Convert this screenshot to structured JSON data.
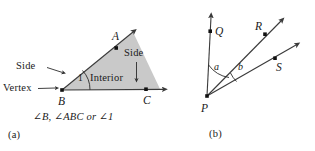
{
  "figure": {
    "colors": {
      "ink": "#1a1a1a",
      "stroke": "#3a3a3a",
      "interior_fill": "#c9c9c9",
      "background": "#ffffff"
    },
    "panel_a": {
      "sublabel": "(a)",
      "caption": "∠B, ∠ABC or ∠1",
      "annotations": {
        "side_left": "Side",
        "side_right": "Side",
        "vertex": "Vertex",
        "interior": "Interior",
        "angle_number": "1"
      },
      "points": [
        {
          "name": "A",
          "label": "A",
          "x": 117,
          "y": 44
        },
        {
          "name": "B",
          "label": "B",
          "x": 62,
          "y": 90
        },
        {
          "name": "C",
          "label": "C",
          "x": 146,
          "y": 89
        }
      ],
      "rays": [
        {
          "name": "ray-BA",
          "from": "B",
          "through": "A",
          "tip_x": 135,
          "tip_y": 30
        },
        {
          "name": "ray-BC",
          "from": "B",
          "through": "C",
          "tip_x": 165,
          "tip_y": 89
        }
      ]
    },
    "panel_b": {
      "sublabel": "(b)",
      "annotations": {
        "angle_a": "a",
        "angle_b": "b"
      },
      "points": [
        {
          "name": "P",
          "label": "P",
          "x": 207,
          "y": 96
        },
        {
          "name": "Q",
          "label": "Q",
          "x": 210,
          "y": 31
        },
        {
          "name": "R",
          "label": "R",
          "x": 265,
          "y": 34
        },
        {
          "name": "S",
          "label": "S",
          "x": 275,
          "y": 58
        }
      ],
      "rays": [
        {
          "name": "ray-PQ",
          "from": "P",
          "through": "Q",
          "tip_x": 211,
          "tip_y": 15
        },
        {
          "name": "ray-PR",
          "from": "P",
          "through": "R",
          "tip_x": 283,
          "tip_y": 19
        },
        {
          "name": "ray-PS",
          "from": "P",
          "through": "S",
          "tip_x": 298,
          "tip_y": 43
        }
      ]
    }
  }
}
